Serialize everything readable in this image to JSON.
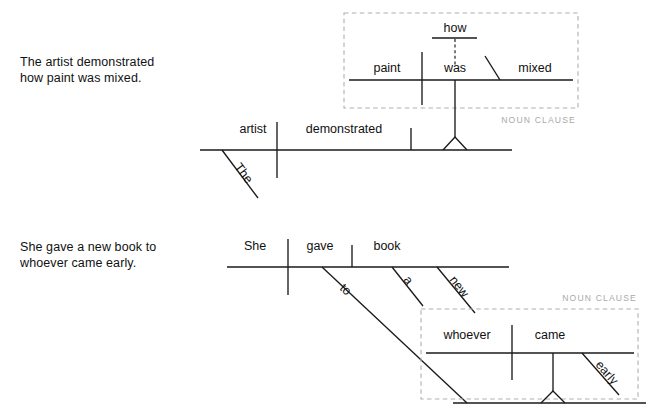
{
  "page": {
    "background": "#ffffff",
    "ink_color": "#1a1a1a",
    "label_color": "#a9a9a9",
    "width": 646,
    "height": 413
  },
  "examples": [
    {
      "id": "example-1",
      "caption": "The artist demonstrated\nhow paint was mixed.",
      "clause_label": "NOUN CLAUSE",
      "clause_type": "noun clause",
      "main_clause": {
        "subject": "artist",
        "subject_modifiers": [
          "The"
        ],
        "verb": "demonstrated",
        "direct_object": "noun clause"
      },
      "embedded_clause": {
        "subject": "paint",
        "verb": "was",
        "predicate_adjective": "mixed",
        "adverb": "how",
        "adverb_connector": "dashed"
      },
      "words": {
        "the": "The",
        "artist": "artist",
        "demonstrated": "demonstrated",
        "paint": "paint",
        "was": "was",
        "mixed": "mixed",
        "how": "how"
      }
    },
    {
      "id": "example-2",
      "caption": "She gave a new book to\nwhoever came early.",
      "clause_label": "NOUN CLAUSE",
      "clause_type": "noun clause",
      "main_clause": {
        "subject": "She",
        "verb": "gave",
        "direct_object": "book",
        "object_modifiers": [
          "a",
          "new"
        ],
        "preposition": "to",
        "prepositional_object": "noun clause"
      },
      "embedded_clause": {
        "subject": "whoever",
        "verb": "came",
        "adverb": "early"
      },
      "words": {
        "she": "She",
        "gave": "gave",
        "book": "book",
        "a": "a",
        "new": "new",
        "to": "to",
        "whoever": "whoever",
        "came": "came",
        "early": "early"
      }
    }
  ]
}
